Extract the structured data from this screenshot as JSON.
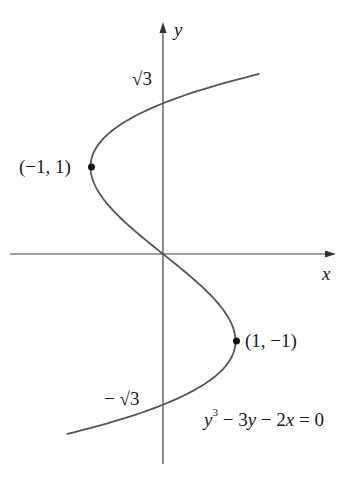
{
  "chart_data": {
    "type": "line",
    "title": "",
    "equation": "y^3 - 3y - 2x = 0",
    "xlabel": "x",
    "ylabel": "y",
    "xlim": [
      -2.2,
      2.4
    ],
    "ylim": [
      -2.4,
      2.6
    ],
    "grid": false,
    "annotations": [
      {
        "text": "(−1, 1)",
        "x": -1,
        "y": 1,
        "marker": "dot"
      },
      {
        "text": "(1, −1)",
        "x": 1,
        "y": -1,
        "marker": "dot"
      },
      {
        "text": "√3",
        "x": 0,
        "y": 1.732,
        "position": "y-axis tick label"
      },
      {
        "text": "−√3",
        "x": 0,
        "y": -1.732,
        "position": "y-axis tick label"
      }
    ],
    "series": [
      {
        "name": "y^3 - 3y - 2x = 0",
        "parametric": "x = (y^3 - 3y)/2",
        "y_range": [
          -2.07,
          2.07
        ],
        "color": "#555555"
      }
    ]
  },
  "labels": {
    "x_axis": "x",
    "y_axis": "y",
    "sqrt3": "√3",
    "neg_sqrt3_minus": "−",
    "neg_sqrt3": "√3",
    "point_max": "(−1, 1)",
    "point_min": "(1, −1)",
    "eq_y": "y",
    "eq_exp": "3",
    "eq_rest_1": " − 3",
    "eq_y2": "y",
    "eq_rest_2": " − 2",
    "eq_x": "x",
    "eq_rest_3": " = 0"
  },
  "colors": {
    "curve": "#555555",
    "axes": "#444444",
    "text": "#1a1a1a"
  }
}
